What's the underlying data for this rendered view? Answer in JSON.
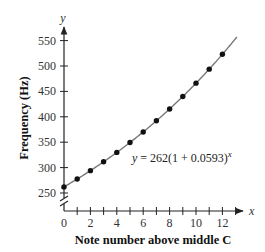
{
  "chart_data": {
    "type": "scatter",
    "title": "",
    "xlabel": "Note number above middle C",
    "ylabel": "Frequency (Hz)",
    "x_axis_letter": "x",
    "y_axis_letter": "y",
    "x": [
      0,
      1,
      2,
      3,
      4,
      5,
      6,
      7,
      8,
      9,
      10,
      11,
      12
    ],
    "series": [
      {
        "name": "Notes",
        "values": [
          262,
          277.5,
          294,
          311.5,
          329.9,
          349.5,
          370.2,
          392.2,
          415.4,
          440.1,
          466.2,
          493.8,
          523.1
        ]
      }
    ],
    "fit": {
      "equation": "y = 262(1 + 0.0593)",
      "exponent": "x",
      "a": 262,
      "r": 0.0593
    },
    "xticks": [
      0,
      2,
      4,
      6,
      8,
      10,
      12
    ],
    "yticks": [
      250,
      300,
      350,
      400,
      450,
      500,
      550
    ],
    "xlim": [
      0,
      13
    ],
    "ylim": [
      250,
      570
    ],
    "axis_break_on_y": true,
    "grid": false,
    "legend": "none"
  }
}
